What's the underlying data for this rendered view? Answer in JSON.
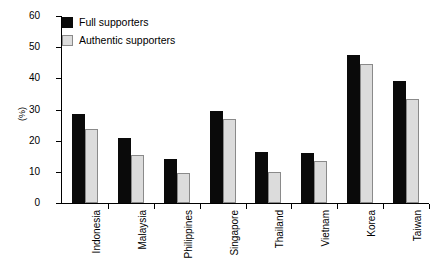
{
  "chart_data": {
    "type": "bar",
    "title": "",
    "subtitle": "",
    "xlabel": "",
    "ylabel": "(%)",
    "ylim": [
      0,
      60
    ],
    "yticks": [
      0,
      10,
      20,
      30,
      40,
      50,
      60
    ],
    "grid": false,
    "legend_position": "top-left",
    "categories": [
      "Indonesia",
      "Malaysia",
      "Philippines",
      "Singapore",
      "Thailand",
      "Vietnam",
      "Korea",
      "Taiwan"
    ],
    "series": [
      {
        "name": "Full supporters",
        "color": "#0a0a0a",
        "values": [
          28.5,
          21.0,
          14.0,
          29.5,
          16.3,
          16.0,
          47.5,
          39.2
        ]
      },
      {
        "name": "Authentic supporters",
        "color": "#dcdcdc",
        "values": [
          23.8,
          15.5,
          9.5,
          26.8,
          10.0,
          13.5,
          44.5,
          33.5
        ]
      }
    ]
  },
  "colors": {
    "full_supporters": "#0a0a0a",
    "authentic_supporters": "#dcdcdc",
    "authentic_border": "#8a8a8a",
    "axis": "#000000",
    "background": "#ffffff"
  }
}
